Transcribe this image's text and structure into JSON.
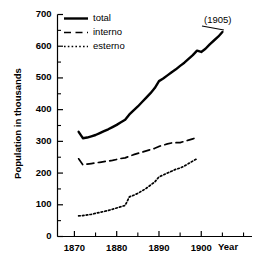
{
  "chart_data": {
    "type": "line",
    "title": "",
    "xlabel": "Year",
    "ylabel": "Population in thousands",
    "xlim": [
      1866,
      1912
    ],
    "ylim": [
      0,
      700
    ],
    "grid": false,
    "legend_position": "top-left",
    "x_ticks_major": [
      1870,
      1880,
      1890,
      1900
    ],
    "x_ticks_minor": [
      1875,
      1885,
      1895,
      1905,
      1910
    ],
    "x_tick_labels": [
      "1870",
      "1880",
      "1890",
      "1900"
    ],
    "y_ticks_major": [
      0,
      100,
      200,
      300,
      400,
      500,
      600,
      700
    ],
    "y_ticks_minor": [
      50,
      150,
      250,
      350,
      450,
      550,
      650
    ],
    "y_tick_labels": [
      "0",
      "100",
      "200",
      "300",
      "400",
      "500",
      "600",
      "700"
    ],
    "annotations": [
      {
        "text": "(1905)",
        "x": 1905,
        "y": 680
      }
    ],
    "series": [
      {
        "name": "total",
        "style": "solid",
        "color": "#000000",
        "x": [
          1871,
          1872,
          1873,
          1874,
          1875,
          1876,
          1877,
          1878,
          1879,
          1880,
          1881,
          1882,
          1883,
          1884,
          1885,
          1886,
          1887,
          1888,
          1889,
          1890,
          1891,
          1892,
          1893,
          1894,
          1895,
          1896,
          1897,
          1898,
          1899,
          1900,
          1901,
          1902,
          1903,
          1904,
          1905
        ],
        "values": [
          330,
          310,
          312,
          316,
          320,
          326,
          332,
          338,
          345,
          352,
          360,
          368,
          385,
          398,
          410,
          424,
          438,
          452,
          468,
          490,
          498,
          508,
          518,
          527,
          538,
          548,
          560,
          572,
          586,
          582,
          592,
          606,
          618,
          630,
          645
        ]
      },
      {
        "name": "interno",
        "style": "dashed",
        "color": "#000000",
        "x": [
          1871,
          1872,
          1873,
          1874,
          1875,
          1876,
          1877,
          1878,
          1879,
          1880,
          1881,
          1882,
          1883,
          1884,
          1885,
          1886,
          1887,
          1888,
          1889,
          1890,
          1891,
          1892,
          1893,
          1894,
          1895,
          1896,
          1897,
          1898,
          1899
        ],
        "values": [
          245,
          226,
          228,
          230,
          232,
          234,
          236,
          238,
          240,
          243,
          246,
          248,
          253,
          258,
          262,
          266,
          270,
          274,
          278,
          284,
          288,
          292,
          295,
          296,
          296,
          300,
          304,
          308,
          312
        ]
      },
      {
        "name": "esterno",
        "style": "dotted",
        "color": "#000000",
        "x": [
          1871,
          1872,
          1873,
          1874,
          1875,
          1876,
          1877,
          1878,
          1879,
          1880,
          1881,
          1882,
          1883,
          1884,
          1885,
          1886,
          1887,
          1888,
          1889,
          1890,
          1891,
          1892,
          1893,
          1894,
          1895,
          1896,
          1897,
          1898,
          1899
        ],
        "values": [
          65,
          66,
          68,
          70,
          73,
          76,
          79,
          82,
          86,
          90,
          94,
          98,
          125,
          130,
          136,
          144,
          152,
          162,
          172,
          188,
          194,
          200,
          206,
          212,
          216,
          222,
          230,
          238,
          245
        ]
      }
    ]
  },
  "legend": {
    "items": [
      {
        "label": "total",
        "style": "solid"
      },
      {
        "label": "interno",
        "style": "dashed"
      },
      {
        "label": "esterno",
        "style": "dotted"
      }
    ]
  }
}
